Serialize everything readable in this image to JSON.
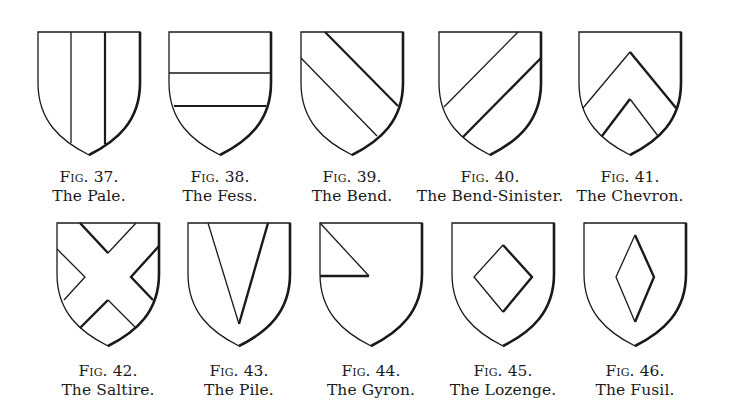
{
  "figures": [
    {
      "fig": "Fig. 37.",
      "name": "The Pale.",
      "charge": "pale"
    },
    {
      "fig": "Fig. 38.",
      "name": "The Fess.",
      "charge": "fess"
    },
    {
      "fig": "Fig. 39.",
      "name": "The Bend.",
      "charge": "bend"
    },
    {
      "fig": "Fig. 40.",
      "name": "The Bend-Sinister.",
      "charge": "bend-sinister"
    },
    {
      "fig": "Fig. 41.",
      "name": "The Chevron.",
      "charge": "chevron"
    },
    {
      "fig": "Fig. 42.",
      "name": "The Saltire.",
      "charge": "saltire"
    },
    {
      "fig": "Fig. 43.",
      "name": "The Pile.",
      "charge": "pile"
    },
    {
      "fig": "Fig. 44.",
      "name": "The Gyron.",
      "charge": "gyron"
    },
    {
      "fig": "Fig. 45.",
      "name": "The Lozenge.",
      "charge": "lozenge"
    },
    {
      "fig": "Fig. 46.",
      "name": "The Fusil.",
      "charge": "fusil"
    }
  ]
}
